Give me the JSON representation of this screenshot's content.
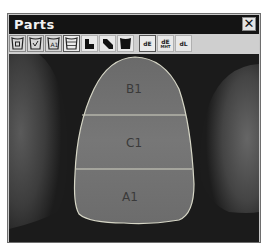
{
  "window": {
    "title": "Parts",
    "close_label": "✕"
  },
  "toolbar": {
    "buttons": [
      {
        "name": "tooth-frame-square",
        "icon": "tooth-frame-square-icon"
      },
      {
        "name": "tooth-frame-check",
        "icon": "tooth-frame-check-icon"
      },
      {
        "name": "tooth-frame-text",
        "icon": "tooth-frame-text-icon"
      },
      {
        "name": "tooth-frame-lines",
        "icon": "tooth-frame-lines-icon"
      },
      {
        "name": "region-split-horizontal",
        "icon": "region-split-horizontal-icon"
      },
      {
        "name": "region-split-diagonal",
        "icon": "region-split-diagonal-icon"
      },
      {
        "name": "region-fill",
        "icon": "region-fill-icon"
      }
    ],
    "text_buttons": [
      {
        "name": "de",
        "label": "dE",
        "sub": ""
      },
      {
        "name": "de-mht",
        "label": "dE",
        "sub": "MHT"
      },
      {
        "name": "dl",
        "label": "dL",
        "sub": ""
      }
    ]
  },
  "image": {
    "regions": [
      {
        "name": "incisal",
        "label": "B1"
      },
      {
        "name": "middle",
        "label": "C1"
      },
      {
        "name": "cervical",
        "label": "A1"
      }
    ],
    "outline_color": "#d8d8c8"
  }
}
